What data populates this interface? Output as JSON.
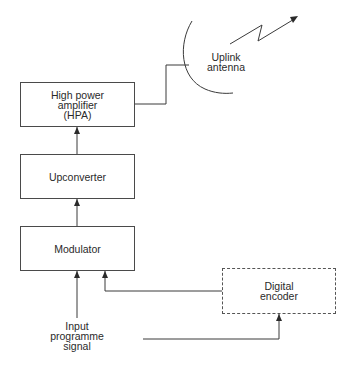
{
  "diagram": {
    "type": "block-diagram",
    "title": "",
    "nodes": [
      {
        "id": "hpa",
        "lines": [
          "High power",
          "amplifier",
          "(HPA)"
        ]
      },
      {
        "id": "upconverter",
        "lines": [
          "Upconverter"
        ]
      },
      {
        "id": "modulator",
        "lines": [
          "Modulator"
        ]
      },
      {
        "id": "digital_encoder",
        "lines": [
          "Digital",
          "encoder"
        ],
        "style": "dashed"
      },
      {
        "id": "uplink_antenna",
        "lines": [
          "Uplink",
          "antenna"
        ]
      },
      {
        "id": "input_signal",
        "lines": [
          "Input",
          "programme",
          "signal"
        ]
      }
    ],
    "edges": [
      {
        "from": "input_signal",
        "to": "modulator"
      },
      {
        "from": "input_signal",
        "to": "digital_encoder"
      },
      {
        "from": "digital_encoder",
        "to": "modulator"
      },
      {
        "from": "modulator",
        "to": "upconverter"
      },
      {
        "from": "upconverter",
        "to": "hpa"
      },
      {
        "from": "hpa",
        "to": "uplink_antenna"
      },
      {
        "from": "uplink_antenna",
        "to": "transmission",
        "style": "zigzag-arrow"
      }
    ]
  },
  "colors": {
    "line": "#3a3a3a",
    "text": "#2a2a2a",
    "background": "#ffffff"
  }
}
